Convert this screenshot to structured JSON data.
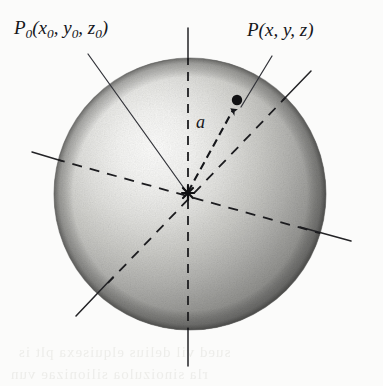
{
  "figure": {
    "background_color": "#fbfbfa",
    "ink_color": "#15161a"
  },
  "labels": {
    "p0": {
      "name": "P",
      "subscript_0": "0",
      "open": "(",
      "x": "x",
      "x_sub": "0",
      "comma1": ",",
      "y": "y",
      "y_sub": "0",
      "comma2": ",",
      "z": "z",
      "z_sub": "0",
      "close": ")",
      "text": "P0(x0, y0, z0)"
    },
    "p": {
      "name": "P",
      "open": "(",
      "x": "x",
      "comma1": ",",
      "y": "y",
      "comma2": ",",
      "z": "z",
      "close": ")",
      "text": "P(x, y, z)"
    },
    "vector": {
      "text": "a"
    }
  },
  "sphere": {
    "center_x": 190,
    "center_y": 194,
    "radius": 136,
    "highlight_x": 140,
    "highlight_y": 150,
    "color_light": "#fcfcfb",
    "color_mid": "#b9b9b6",
    "color_dark": "#6d6d6b",
    "color_edge": "#4f4f4e"
  },
  "points": {
    "p0": {
      "x": 188,
      "y": 193,
      "label": "P0",
      "style": "cross"
    },
    "p": {
      "x": 237,
      "y": 100,
      "label": "P",
      "style": "filled-dot",
      "radius": 5
    }
  },
  "axes": [
    {
      "name": "z-axis",
      "x1": 188,
      "y1": 28,
      "x2": 188,
      "y2": 366,
      "style_outside": "solid",
      "style_inside": "dashed"
    },
    {
      "name": "x-axis",
      "x1": 76,
      "y1": 316,
      "x2": 311,
      "y2": 71,
      "style_outside": "solid",
      "style_inside": "dashed"
    },
    {
      "name": "y-axis",
      "x1": 32,
      "y1": 152,
      "x2": 351,
      "y2": 241,
      "style_outside": "solid",
      "style_inside": "dashed"
    }
  ],
  "leaders": [
    {
      "name": "leader-p0",
      "x1": 88,
      "y1": 54,
      "x2": 186,
      "y2": 191
    },
    {
      "name": "leader-p",
      "x1": 271,
      "y1": 56,
      "x2": 240,
      "y2": 108
    }
  ],
  "vector": {
    "name": "vector-a",
    "from_x": 188,
    "from_y": 193,
    "to_x": 234,
    "to_y": 108,
    "style": "dashed-with-arrowhead"
  },
  "ghost_text": {
    "line1": "sued vil delius elquisexa plt is",
    "line2": "rla sinoizuloa silionizae vun",
    "line3": "unsb"
  }
}
